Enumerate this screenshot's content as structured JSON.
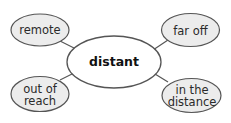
{
  "diagram": {
    "type": "word-web",
    "center": {
      "label": "distant"
    },
    "nodes": [
      {
        "id": "remote",
        "label": "remote",
        "position": "top-left"
      },
      {
        "id": "far-off",
        "label": "far off",
        "position": "top-right"
      },
      {
        "id": "out-of-reach",
        "label": "out of reach",
        "position": "bottom-left"
      },
      {
        "id": "in-the-distance",
        "label": "in the distance",
        "position": "bottom-right"
      }
    ],
    "colors": {
      "node_fill": "#ececec",
      "center_fill": "#ffffff",
      "stroke": "#555555",
      "text": "#222222"
    }
  }
}
